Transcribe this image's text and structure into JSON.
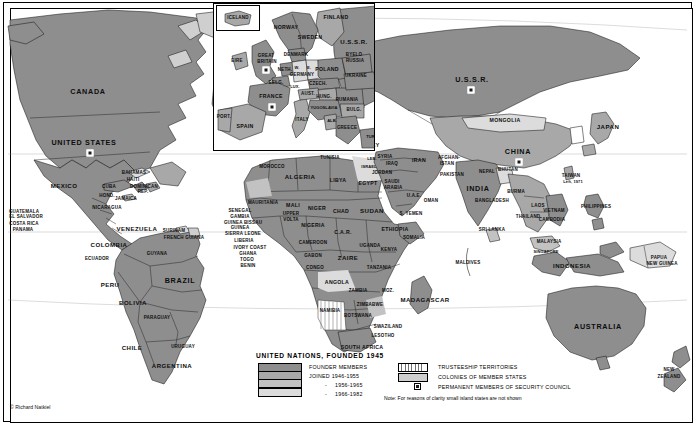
{
  "figure": {
    "credit": "© Richard Natkiel"
  },
  "legend": {
    "title": "UNITED NATIONS, FOUNDED 1945",
    "left_items": [
      {
        "label": "FOUNDER MEMBERS",
        "swatch": "#8e8e8e",
        "indent": false,
        "dash": false
      },
      {
        "label": "JOINED 1946-1955",
        "swatch": "#a8a8a8",
        "indent": false,
        "dash": false
      },
      {
        "label": "1956-1965",
        "swatch": "#c2c2c2",
        "indent": true,
        "dash": true
      },
      {
        "label": "1966-1982",
        "swatch": "#dcdcdc",
        "indent": true,
        "dash": true
      }
    ],
    "right_items": [
      {
        "label": "TRUSTEESHIP TERRITORIES",
        "swatch": "hatch"
      },
      {
        "label": "COLONIES OF MEMBER STATES",
        "swatch": "#cfcfcf"
      },
      {
        "label": "PERMANENT MEMBERS OF SECURITY COUNCIL",
        "swatch": "marker"
      }
    ],
    "note": "Note: For reasons of clarity small island states are not shown"
  },
  "inset": {
    "name": "europe-inset",
    "iceland_label": "ICELAND",
    "labels": [
      {
        "text": "ICELAND",
        "x": 24,
        "y": 14,
        "size": "s-xs"
      },
      {
        "text": "NORWAY",
        "x": 72,
        "y": 24,
        "size": "s-sm"
      },
      {
        "text": "SWEDEN",
        "x": 96,
        "y": 34,
        "size": "s-sm"
      },
      {
        "text": "FINLAND",
        "x": 122,
        "y": 14,
        "size": "s-sm"
      },
      {
        "text": "U.S.S.R.",
        "x": 140,
        "y": 38,
        "size": "s-md"
      },
      {
        "text": "DENMARK",
        "x": 82,
        "y": 51,
        "size": "s-xs"
      },
      {
        "text": "EIRE",
        "x": 23,
        "y": 57,
        "size": "s-xs"
      },
      {
        "text": "GREAT",
        "x": 52,
        "y": 52,
        "size": "s-xs"
      },
      {
        "text": "BRITAIN",
        "x": 53,
        "y": 58,
        "size": "s-xs"
      },
      {
        "text": "NETH.",
        "x": 71,
        "y": 66,
        "size": "s-xs"
      },
      {
        "text": "W.",
        "x": 83,
        "y": 64,
        "size": "s-tiny"
      },
      {
        "text": "E.",
        "x": 95,
        "y": 64,
        "size": "s-tiny"
      },
      {
        "text": "GERMANY",
        "x": 88,
        "y": 71,
        "size": "s-xs"
      },
      {
        "text": "BELG.",
        "x": 62,
        "y": 79,
        "size": "s-xs"
      },
      {
        "text": "LUX.",
        "x": 81,
        "y": 83,
        "size": "s-tiny"
      },
      {
        "text": "FRANCE",
        "x": 57,
        "y": 93,
        "size": "s-sm"
      },
      {
        "text": "PORT.",
        "x": 10,
        "y": 113,
        "size": "s-xs"
      },
      {
        "text": "SPAIN",
        "x": 31,
        "y": 123,
        "size": "s-sm"
      },
      {
        "text": "ITALY",
        "x": 88,
        "y": 116,
        "size": "s-xs"
      },
      {
        "text": "AUST.",
        "x": 94,
        "y": 90,
        "size": "s-xs"
      },
      {
        "text": "CZECH.",
        "x": 104,
        "y": 80,
        "size": "s-xs"
      },
      {
        "text": "POLAND",
        "x": 113,
        "y": 66,
        "size": "s-sm"
      },
      {
        "text": "BYELO",
        "x": 140,
        "y": 51,
        "size": "s-xs"
      },
      {
        "text": "RUSSIA",
        "x": 141,
        "y": 57,
        "size": "s-xs"
      },
      {
        "text": "UKRAINE",
        "x": 142,
        "y": 72,
        "size": "s-xs"
      },
      {
        "text": "HUNG.",
        "x": 110,
        "y": 93,
        "size": "s-xs"
      },
      {
        "text": "RUMANIA",
        "x": 133,
        "y": 96,
        "size": "s-xs"
      },
      {
        "text": "YUGOSLAVIA",
        "x": 110,
        "y": 104,
        "size": "s-tiny"
      },
      {
        "text": "BULG.",
        "x": 140,
        "y": 106,
        "size": "s-xs"
      },
      {
        "text": "ALB.",
        "x": 118,
        "y": 117,
        "size": "s-tiny"
      },
      {
        "text": "GREECE",
        "x": 133,
        "y": 124,
        "size": "s-xs"
      },
      {
        "text": "TUR.",
        "x": 157,
        "y": 133,
        "size": "s-tiny"
      }
    ],
    "sc_markers": [
      {
        "name": "security-council-marker-great-britain",
        "x": 52,
        "y": 66
      },
      {
        "name": "security-council-marker-france",
        "x": 58,
        "y": 103
      }
    ]
  },
  "map": {
    "labels": [
      {
        "text": "CANADA",
        "x": 88,
        "y": 92,
        "size": "s-lg"
      },
      {
        "text": "UNITED STATES",
        "x": 84,
        "y": 143,
        "size": "s-lg"
      },
      {
        "text": "MEXICO",
        "x": 64,
        "y": 186,
        "size": "s-md"
      },
      {
        "text": "BAHAMAS",
        "x": 134,
        "y": 173,
        "size": "s-xs"
      },
      {
        "text": "HAITI",
        "x": 133,
        "y": 180,
        "size": "s-xs"
      },
      {
        "text": "DOMINICAN",
        "x": 144,
        "y": 187,
        "size": "s-xs"
      },
      {
        "text": "REP.",
        "x": 143,
        "y": 192,
        "size": "s-xs"
      },
      {
        "text": "CUBA",
        "x": 109,
        "y": 187,
        "size": "s-xs"
      },
      {
        "text": "HOND.",
        "x": 107,
        "y": 196,
        "size": "s-xs"
      },
      {
        "text": "JAMAICA",
        "x": 126,
        "y": 199,
        "size": "s-xs"
      },
      {
        "text": "NICARAGUA",
        "x": 107,
        "y": 208,
        "size": "s-xs"
      },
      {
        "text": "GUATEMALA",
        "x": 24,
        "y": 212,
        "size": "s-xs"
      },
      {
        "text": "EL SALVADOR",
        "x": 26,
        "y": 217,
        "size": "s-xs"
      },
      {
        "text": "COSTA RICA",
        "x": 24,
        "y": 224,
        "size": "s-xs"
      },
      {
        "text": "PANAMA",
        "x": 23,
        "y": 230,
        "size": "s-xs"
      },
      {
        "text": "COLOMBIA",
        "x": 109,
        "y": 245,
        "size": "s-md"
      },
      {
        "text": "VENEZUELA",
        "x": 137,
        "y": 229,
        "size": "s-md"
      },
      {
        "text": "SURINAM",
        "x": 174,
        "y": 231,
        "size": "s-xs"
      },
      {
        "text": "FRENCH GUIANA",
        "x": 184,
        "y": 238,
        "size": "s-xs"
      },
      {
        "text": "GUYANA",
        "x": 157,
        "y": 254,
        "size": "s-xs"
      },
      {
        "text": "ECUADOR",
        "x": 97,
        "y": 259,
        "size": "s-xs"
      },
      {
        "text": "PERU",
        "x": 110,
        "y": 285,
        "size": "s-md"
      },
      {
        "text": "BRAZIL",
        "x": 180,
        "y": 281,
        "size": "s-lg"
      },
      {
        "text": "BOLIVIA",
        "x": 133,
        "y": 303,
        "size": "s-md"
      },
      {
        "text": "PARAGUAY",
        "x": 157,
        "y": 318,
        "size": "s-xs"
      },
      {
        "text": "CHILE",
        "x": 132,
        "y": 348,
        "size": "s-md"
      },
      {
        "text": "URUGUAY",
        "x": 183,
        "y": 347,
        "size": "s-xs"
      },
      {
        "text": "ARGENTINA",
        "x": 172,
        "y": 366,
        "size": "s-md"
      },
      {
        "text": "MOROCCO",
        "x": 272,
        "y": 167,
        "size": "s-xs"
      },
      {
        "text": "TUNISIA",
        "x": 330,
        "y": 158,
        "size": "s-xs"
      },
      {
        "text": "ALGERIA",
        "x": 300,
        "y": 177,
        "size": "s-md"
      },
      {
        "text": "LIBYA",
        "x": 338,
        "y": 181,
        "size": "s-sm"
      },
      {
        "text": "EGYPT",
        "x": 368,
        "y": 184,
        "size": "s-sm"
      },
      {
        "text": "MAURITANIA",
        "x": 263,
        "y": 203,
        "size": "s-xs"
      },
      {
        "text": "MALI",
        "x": 293,
        "y": 206,
        "size": "s-sm"
      },
      {
        "text": "NIGER",
        "x": 317,
        "y": 209,
        "size": "s-sm"
      },
      {
        "text": "CHAD",
        "x": 341,
        "y": 212,
        "size": "s-sm"
      },
      {
        "text": "SUDAN",
        "x": 372,
        "y": 211,
        "size": "s-md"
      },
      {
        "text": "SENEGAL",
        "x": 240,
        "y": 211,
        "size": "s-xs"
      },
      {
        "text": "GAMBIA",
        "x": 240,
        "y": 217,
        "size": "s-xs"
      },
      {
        "text": "GUINEA BISSAU",
        "x": 243,
        "y": 223,
        "size": "s-xs"
      },
      {
        "text": "GUINEA",
        "x": 240,
        "y": 228,
        "size": "s-xs"
      },
      {
        "text": "SIERRA LEONE",
        "x": 243,
        "y": 234,
        "size": "s-xs"
      },
      {
        "text": "LIBERIA",
        "x": 244,
        "y": 241,
        "size": "s-xs"
      },
      {
        "text": "IVORY COAST",
        "x": 250,
        "y": 248,
        "size": "s-xs"
      },
      {
        "text": "GHANA",
        "x": 248,
        "y": 254,
        "size": "s-xs"
      },
      {
        "text": "TOGO",
        "x": 247,
        "y": 260,
        "size": "s-xs"
      },
      {
        "text": "BENIN",
        "x": 248,
        "y": 266,
        "size": "s-xs"
      },
      {
        "text": "UPPER",
        "x": 291,
        "y": 214,
        "size": "s-xs"
      },
      {
        "text": "VOLTA",
        "x": 291,
        "y": 220,
        "size": "s-xs"
      },
      {
        "text": "NIGERIA",
        "x": 313,
        "y": 226,
        "size": "s-sm"
      },
      {
        "text": "CAMEROON",
        "x": 313,
        "y": 243,
        "size": "s-xs"
      },
      {
        "text": "C.A.R.",
        "x": 343,
        "y": 233,
        "size": "s-sm"
      },
      {
        "text": "GABON",
        "x": 313,
        "y": 256,
        "size": "s-xs"
      },
      {
        "text": "CONGO",
        "x": 315,
        "y": 268,
        "size": "s-xs"
      },
      {
        "text": "ZAIRE",
        "x": 348,
        "y": 258,
        "size": "s-md"
      },
      {
        "text": "ETHIOPIA",
        "x": 395,
        "y": 230,
        "size": "s-sm"
      },
      {
        "text": "SOMALIA",
        "x": 414,
        "y": 238,
        "size": "s-xs"
      },
      {
        "text": "UGANDA",
        "x": 370,
        "y": 246,
        "size": "s-xs"
      },
      {
        "text": "KENYA",
        "x": 389,
        "y": 250,
        "size": "s-xs"
      },
      {
        "text": "TANZANIA",
        "x": 379,
        "y": 268,
        "size": "s-xs"
      },
      {
        "text": "ANGOLA",
        "x": 337,
        "y": 283,
        "size": "s-sm"
      },
      {
        "text": "ZAMBIA",
        "x": 358,
        "y": 291,
        "size": "s-xs"
      },
      {
        "text": "MOZ.",
        "x": 388,
        "y": 291,
        "size": "s-xs"
      },
      {
        "text": "ZIMBABWE",
        "x": 370,
        "y": 305,
        "size": "s-xs"
      },
      {
        "text": "NAMIBIA",
        "x": 330,
        "y": 311,
        "size": "s-xs"
      },
      {
        "text": "BOTSWANA",
        "x": 358,
        "y": 316,
        "size": "s-xs"
      },
      {
        "text": "SWAZILAND",
        "x": 388,
        "y": 327,
        "size": "s-xs"
      },
      {
        "text": "LESOTHO",
        "x": 383,
        "y": 336,
        "size": "s-xs"
      },
      {
        "text": "SOUTH AFRICA",
        "x": 362,
        "y": 348,
        "size": "s-sm"
      },
      {
        "text": "MADAGASCAR",
        "x": 425,
        "y": 300,
        "size": "s-md"
      },
      {
        "text": "TURKEY",
        "x": 368,
        "y": 146,
        "size": "s-sm"
      },
      {
        "text": "SYRIA",
        "x": 385,
        "y": 157,
        "size": "s-xs"
      },
      {
        "text": "LEB.",
        "x": 372,
        "y": 159,
        "size": "s-tiny"
      },
      {
        "text": "ISRAEL",
        "x": 369,
        "y": 167,
        "size": "s-tiny"
      },
      {
        "text": "IRAQ",
        "x": 392,
        "y": 164,
        "size": "s-xs"
      },
      {
        "text": "JORDAN",
        "x": 382,
        "y": 173,
        "size": "s-xs"
      },
      {
        "text": "IRAN",
        "x": 419,
        "y": 161,
        "size": "s-sm"
      },
      {
        "text": "AFGHAN-",
        "x": 449,
        "y": 158,
        "size": "s-xs"
      },
      {
        "text": "ISTAN",
        "x": 447,
        "y": 164,
        "size": "s-xs"
      },
      {
        "text": "PAKISTAN",
        "x": 452,
        "y": 175,
        "size": "s-xs"
      },
      {
        "text": "SAUDI",
        "x": 392,
        "y": 182,
        "size": "s-xs"
      },
      {
        "text": "ARABIA",
        "x": 393,
        "y": 188,
        "size": "s-xs"
      },
      {
        "text": "U.A.E.",
        "x": 414,
        "y": 196,
        "size": "s-xs"
      },
      {
        "text": "OMAN",
        "x": 431,
        "y": 201,
        "size": "s-xs"
      },
      {
        "text": "S. YEMEN",
        "x": 411,
        "y": 214,
        "size": "s-xs"
      },
      {
        "text": "INDIA",
        "x": 478,
        "y": 189,
        "size": "s-lg"
      },
      {
        "text": "NEPAL",
        "x": 487,
        "y": 172,
        "size": "s-xs"
      },
      {
        "text": "BHUTAN",
        "x": 508,
        "y": 170,
        "size": "s-xs"
      },
      {
        "text": "BANGLADESH",
        "x": 492,
        "y": 201,
        "size": "s-xs"
      },
      {
        "text": "BURMA",
        "x": 516,
        "y": 192,
        "size": "s-xs"
      },
      {
        "text": "SRI LANKA",
        "x": 492,
        "y": 230,
        "size": "s-xs"
      },
      {
        "text": "MALDIVES",
        "x": 468,
        "y": 263,
        "size": "s-xs"
      },
      {
        "text": "MONGOLIA",
        "x": 505,
        "y": 121,
        "size": "s-sm"
      },
      {
        "text": "CHINA",
        "x": 518,
        "y": 152,
        "size": "s-lg"
      },
      {
        "text": "U.S.S.R.",
        "x": 472,
        "y": 80,
        "size": "s-lg"
      },
      {
        "text": "JAPAN",
        "x": 608,
        "y": 127,
        "size": "s-md"
      },
      {
        "text": "TAIWAN",
        "x": 571,
        "y": 176,
        "size": "s-xs"
      },
      {
        "text": "Left, 1971",
        "x": 573,
        "y": 182,
        "size": "s-tiny"
      },
      {
        "text": "PHILIPPINES",
        "x": 596,
        "y": 207,
        "size": "s-xs"
      },
      {
        "text": "THAILAND",
        "x": 528,
        "y": 217,
        "size": "s-xs"
      },
      {
        "text": "LAOS",
        "x": 538,
        "y": 206,
        "size": "s-xs"
      },
      {
        "text": "VIETNAM",
        "x": 554,
        "y": 211,
        "size": "s-xs"
      },
      {
        "text": "CAMBODIA",
        "x": 552,
        "y": 220,
        "size": "s-xs"
      },
      {
        "text": "MALAYSIA",
        "x": 549,
        "y": 242,
        "size": "s-xs"
      },
      {
        "text": "SINGAPORE",
        "x": 546,
        "y": 252,
        "size": "s-tiny"
      },
      {
        "text": "INDONESIA",
        "x": 572,
        "y": 266,
        "size": "s-md"
      },
      {
        "text": "PAPUA",
        "x": 659,
        "y": 258,
        "size": "s-xs"
      },
      {
        "text": "NEW GUINEA",
        "x": 662,
        "y": 264,
        "size": "s-xs"
      },
      {
        "text": "AUSTRALIA",
        "x": 598,
        "y": 327,
        "size": "s-lg"
      },
      {
        "text": "NEW",
        "x": 669,
        "y": 370,
        "size": "s-xs"
      },
      {
        "text": "ZEALAND",
        "x": 669,
        "y": 377,
        "size": "s-xs"
      }
    ],
    "sc_markers": [
      {
        "name": "security-council-marker-united-states",
        "x": 90,
        "y": 153
      },
      {
        "name": "security-council-marker-ussr",
        "x": 471,
        "y": 90
      },
      {
        "name": "security-council-marker-china",
        "x": 519,
        "y": 162
      }
    ]
  }
}
